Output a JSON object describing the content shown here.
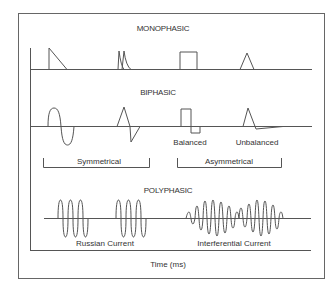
{
  "sections": {
    "monophasic": {
      "title": "MONOPHASIC"
    },
    "biphasic": {
      "title": "BIPHASIC",
      "labels": {
        "balanced": "Balanced",
        "unbalanced": "Unbalanced"
      },
      "groups": {
        "symmetrical": "Symmetrical",
        "asymmetrical": "Asymmetrical"
      }
    },
    "polyphasic": {
      "title": "POLYPHASIC",
      "labels": {
        "russian": "Russian Current",
        "interferential": "Interferential Current"
      }
    }
  },
  "axis": {
    "x_label": "Time (ms)"
  },
  "colors": {
    "line": "#555555",
    "text": "#333333",
    "frame": "#666666",
    "background": "#ffffff"
  }
}
